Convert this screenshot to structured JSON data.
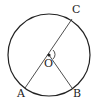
{
  "diagram": {
    "type": "circle-geometry",
    "circle": {
      "center_label": "O",
      "cx": 49,
      "cy": 55,
      "r": 41
    },
    "points": [
      {
        "label": "A",
        "x": 25,
        "y": 88,
        "lx": 17,
        "ly": 95
      },
      {
        "label": "B",
        "x": 72,
        "y": 88,
        "lx": 73,
        "ly": 95
      },
      {
        "label": "C",
        "x": 72,
        "y": 19,
        "lx": 72,
        "ly": 13
      },
      {
        "label": "O",
        "x": 49,
        "y": 55,
        "lx": 44,
        "ly": 67
      }
    ],
    "segments": [
      [
        "A",
        "C"
      ],
      [
        "O",
        "B"
      ]
    ],
    "angle_mark": {
      "at": "O",
      "between": [
        "C",
        "B"
      ]
    },
    "colors": {
      "stroke": "#222222",
      "background": "#ffffff"
    }
  }
}
